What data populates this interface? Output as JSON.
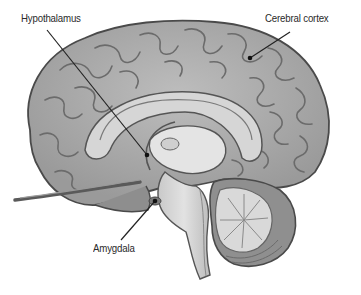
{
  "diagram": {
    "labels": [
      {
        "id": "hypothalamus",
        "text": "Hypothalamus",
        "x": 21,
        "y": 13,
        "line": [
          47,
          30,
          147,
          155
        ]
      },
      {
        "id": "cerebral-cortex",
        "text": "Cerebral cortex",
        "x": 265,
        "y": 13,
        "line": [
          290,
          32,
          250,
          58
        ]
      },
      {
        "id": "amygdala",
        "text": "Amygdala",
        "x": 93,
        "y": 243,
        "line": [
          121,
          240,
          155,
          201
        ]
      }
    ],
    "colors": {
      "background": "#ffffff",
      "cortex_fill": "#a9a9a9",
      "cortex_dark": "#6e6e6e",
      "inner_light": "#d4d4d4",
      "outline": "#4a4a4a",
      "label_text": "#2a2a2a",
      "leader_line": "#222222"
    }
  }
}
